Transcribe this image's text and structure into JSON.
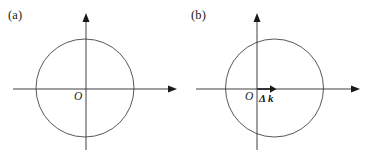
{
  "figure": {
    "background_color": "#ffffff",
    "line_color": "#2b2b2b",
    "circle_color": "#3a3a3a",
    "width": 366,
    "height": 162
  },
  "panels": [
    {
      "id": "a",
      "label": "(a)",
      "origin_label": "O",
      "vector_label": "",
      "axes": {
        "x_axis": {
          "y": 89,
          "x_start": 13,
          "x_end": 176,
          "arrow": "right"
        },
        "y_axis": {
          "x": 86,
          "y_start": 150,
          "y_end": 14,
          "arrow": "up"
        }
      },
      "circle": {
        "cx": 85,
        "cy": 88,
        "r": 49,
        "offset_from_origin": 0
      }
    },
    {
      "id": "b",
      "label": "(b)",
      "origin_label": "O",
      "vector_label": "Δ k",
      "axes": {
        "x_axis": {
          "y": 89,
          "x_start": 13,
          "x_end": 176,
          "arrow": "right"
        },
        "y_axis": {
          "x": 74,
          "y_start": 150,
          "y_end": 14,
          "arrow": "up"
        }
      },
      "circle": {
        "cx": 91.5,
        "cy": 88,
        "r": 49,
        "offset_from_origin": 17.5
      },
      "delta_vector": {
        "x_start": 74,
        "x_end": 91,
        "y": 89,
        "arrow": "right"
      }
    }
  ]
}
